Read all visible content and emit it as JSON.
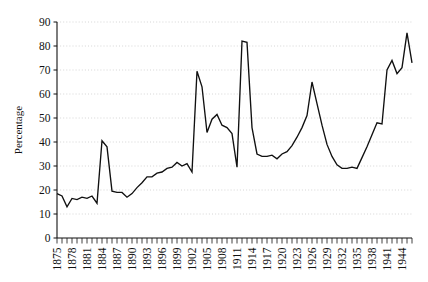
{
  "chart_data": {
    "type": "line",
    "title": "",
    "subtitle": "",
    "xlabel": "",
    "ylabel": "Percentage",
    "xlim": [
      1875,
      1946
    ],
    "ylim": [
      0,
      90
    ],
    "grid": true,
    "legend": null,
    "y_ticks": [
      0,
      10,
      20,
      30,
      40,
      50,
      60,
      70,
      80,
      90
    ],
    "y_tick_labels": [
      "0",
      "10",
      "20",
      "30",
      "40",
      "50",
      "60",
      "70",
      "80",
      "90"
    ],
    "x_tick_labels": [
      "1875",
      "1878",
      "1881",
      "1884",
      "1887",
      "1890",
      "1893",
      "1896",
      "1899",
      "1902",
      "1905",
      "1908",
      "1911",
      "1914",
      "1917",
      "1920",
      "1923",
      "1926",
      "1929",
      "1932",
      "1935",
      "1938",
      "1941",
      "1944"
    ],
    "x_tick_step": 3,
    "x_minor_tick_step": 1,
    "series": [
      {
        "name": "Percentage",
        "color": "#101010",
        "x": [
          1875,
          1876,
          1877,
          1878,
          1879,
          1880,
          1881,
          1882,
          1883,
          1884,
          1885,
          1886,
          1887,
          1888,
          1889,
          1890,
          1891,
          1892,
          1893,
          1894,
          1895,
          1896,
          1897,
          1898,
          1899,
          1900,
          1901,
          1902,
          1903,
          1904,
          1905,
          1906,
          1907,
          1908,
          1909,
          1910,
          1911,
          1912,
          1913,
          1914,
          1915,
          1916,
          1917,
          1918,
          1919,
          1920,
          1921,
          1922,
          1923,
          1924,
          1925,
          1926,
          1927,
          1928,
          1929,
          1930,
          1931,
          1932,
          1933,
          1934,
          1935,
          1936,
          1937,
          1938,
          1939,
          1940,
          1941,
          1942,
          1943,
          1944,
          1945,
          1946
        ],
        "values": [
          18.5,
          17.5,
          13.0,
          16.5,
          16.0,
          17.0,
          16.5,
          17.5,
          14.5,
          40.5,
          38.0,
          19.5,
          19.0,
          19.0,
          17.0,
          18.5,
          21.0,
          23.0,
          25.5,
          25.5,
          27.0,
          27.5,
          29.0,
          29.5,
          31.5,
          30.0,
          31.0,
          27.5,
          69.5,
          63.0,
          44.0,
          49.5,
          51.5,
          47.0,
          46.0,
          43.5,
          29.5,
          82.0,
          81.5,
          46.0,
          35.0,
          34.0,
          34.0,
          34.5,
          33.0,
          35.0,
          36.0,
          38.5,
          42.0,
          46.0,
          51.0,
          65.0,
          56.0,
          47.0,
          39.0,
          34.0,
          30.5,
          29.0,
          29.0,
          29.5,
          29.0,
          33.5,
          38.0,
          43.0,
          48.0,
          47.5,
          70.0,
          74.0,
          68.5,
          71.0,
          85.5,
          73.0
        ]
      }
    ]
  },
  "axes": {
    "y_axis_title": "Percentage"
  }
}
